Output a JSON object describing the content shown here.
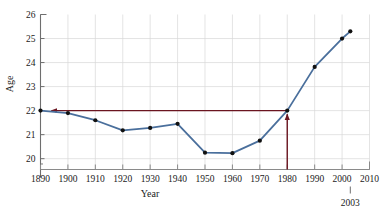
{
  "chart_data": {
    "type": "line",
    "title": "",
    "xlabel": "Year",
    "ylabel": "Age",
    "xlim": [
      1890,
      2010
    ],
    "ylim": [
      19.55,
      26
    ],
    "grid": true,
    "legend": "none",
    "x_ticks": [
      1890,
      1900,
      1910,
      1920,
      1930,
      1940,
      1950,
      1960,
      1970,
      1980,
      1990,
      2000,
      2010
    ],
    "x_tick_labels": [
      "1890",
      "1900",
      "1910",
      "1920",
      "1930",
      "1940",
      "1950",
      "1960",
      "1970",
      "1980",
      "1990",
      "2000",
      "2010"
    ],
    "y_ticks": [
      20,
      21,
      22,
      23,
      24,
      25,
      26
    ],
    "y_tick_labels": [
      "20",
      "21",
      "22",
      "23",
      "24",
      "25",
      "26"
    ],
    "series": [
      {
        "name": "Median age at first marriage",
        "color": "#4a6f9c",
        "marker_color": "#111111",
        "x": [
          1890,
          1900,
          1910,
          1920,
          1930,
          1940,
          1950,
          1960,
          1970,
          1980,
          1990,
          2000,
          2003
        ],
        "values": [
          22.0,
          21.9,
          21.6,
          21.18,
          21.28,
          21.45,
          20.25,
          20.23,
          20.75,
          22.0,
          23.82,
          25.0,
          25.3
        ]
      }
    ],
    "annotations": [
      {
        "name": "reference-line-horizontal",
        "type": "arrow",
        "color": "#6b1520",
        "x_start": 1980,
        "y_start": 22.0,
        "x_end": 1894,
        "y_end": 22.0,
        "label": ""
      },
      {
        "name": "reference-line-vertical",
        "type": "arrow",
        "color": "#6b1520",
        "x_start": 1980,
        "y_start": 19.55,
        "x_end": 1980,
        "y_end": 21.85,
        "label": ""
      },
      {
        "name": "year-2003-callout",
        "type": "text-tick",
        "x": 2003,
        "label": "2003"
      }
    ]
  }
}
